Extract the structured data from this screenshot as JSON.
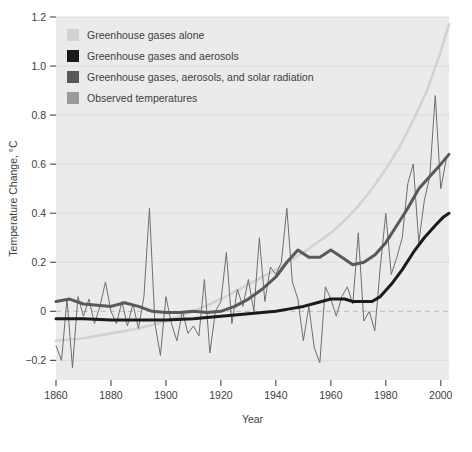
{
  "figure": {
    "plot_bg_color": "#ebebeb",
    "page_bg_color": "#ffffff",
    "grid_color": "#dcdcdc",
    "zero_line_color": "#b9b9b9",
    "text_color": "#3d3d3d",
    "tick_color": "#555555"
  },
  "chart_data": {
    "type": "line",
    "title": "",
    "xlabel": "Year",
    "ylabel": "Temperature Change, °C",
    "xlim": [
      1860,
      2003
    ],
    "ylim": [
      -0.28,
      1.2
    ],
    "xticks": [
      1860,
      1880,
      1900,
      1920,
      1940,
      1960,
      1980,
      2000
    ],
    "yticks": [
      -0.2,
      0,
      0.2,
      0.4,
      0.6,
      0.8,
      1.0,
      1.2
    ],
    "ytick_labels": [
      "−0.2",
      "0",
      "0.2",
      "0.4",
      "0.6",
      "0.8",
      "1.0",
      "1.2"
    ],
    "xtick_labels": [
      "1860",
      "1880",
      "1900",
      "1920",
      "1940",
      "1960",
      "1980",
      "2000"
    ],
    "grid": true,
    "legend_position": "top-left",
    "zero_reference_line": 0,
    "series": [
      {
        "name": "Greenhouse gases alone",
        "color": "#d2d2d2",
        "width": 2.6,
        "x": [
          1860,
          1870,
          1880,
          1890,
          1900,
          1910,
          1920,
          1930,
          1940,
          1950,
          1960,
          1965,
          1970,
          1975,
          1980,
          1985,
          1990,
          1995,
          2000,
          2003
        ],
        "values": [
          -0.12,
          -0.11,
          -0.09,
          -0.07,
          -0.04,
          0.0,
          0.05,
          0.11,
          0.17,
          0.24,
          0.32,
          0.37,
          0.43,
          0.5,
          0.58,
          0.67,
          0.78,
          0.9,
          1.06,
          1.17
        ]
      },
      {
        "name": "Greenhouse gases and aerosols",
        "color": "#1b1b1b",
        "width": 3.0,
        "x": [
          1860,
          1870,
          1880,
          1890,
          1900,
          1910,
          1920,
          1930,
          1940,
          1945,
          1950,
          1955,
          1960,
          1965,
          1968,
          1972,
          1975,
          1978,
          1982,
          1986,
          1990,
          1994,
          1998,
          2001,
          2003
        ],
        "values": [
          -0.03,
          -0.03,
          -0.035,
          -0.035,
          -0.035,
          -0.03,
          -0.02,
          -0.01,
          0.0,
          0.01,
          0.02,
          0.035,
          0.05,
          0.05,
          0.04,
          0.04,
          0.04,
          0.06,
          0.11,
          0.17,
          0.24,
          0.3,
          0.35,
          0.385,
          0.4
        ]
      },
      {
        "name": "Greenhouse gases, aerosols, and solar radiation",
        "color": "#595959",
        "width": 3.0,
        "x": [
          1860,
          1865,
          1870,
          1875,
          1880,
          1885,
          1890,
          1895,
          1900,
          1905,
          1910,
          1915,
          1920,
          1925,
          1930,
          1935,
          1940,
          1944,
          1948,
          1952,
          1956,
          1960,
          1964,
          1968,
          1972,
          1976,
          1980,
          1984,
          1988,
          1992,
          1996,
          2000,
          2003
        ],
        "values": [
          0.04,
          0.05,
          0.03,
          0.025,
          0.02,
          0.035,
          0.02,
          0.0,
          -0.005,
          -0.005,
          0.0,
          -0.005,
          0.0,
          0.02,
          0.05,
          0.09,
          0.14,
          0.2,
          0.25,
          0.22,
          0.22,
          0.25,
          0.22,
          0.19,
          0.2,
          0.23,
          0.28,
          0.35,
          0.42,
          0.5,
          0.55,
          0.6,
          0.64
        ]
      },
      {
        "name": "Observed temperatures",
        "color": "#6e6e6e",
        "width": 1.0,
        "x": [
          1860,
          1862,
          1864,
          1866,
          1868,
          1870,
          1872,
          1874,
          1876,
          1878,
          1880,
          1882,
          1884,
          1886,
          1888,
          1890,
          1892,
          1894,
          1896,
          1898,
          1900,
          1902,
          1904,
          1906,
          1908,
          1910,
          1912,
          1914,
          1916,
          1918,
          1920,
          1922,
          1924,
          1926,
          1928,
          1930,
          1932,
          1934,
          1936,
          1938,
          1940,
          1942,
          1944,
          1946,
          1948,
          1950,
          1952,
          1954,
          1956,
          1958,
          1960,
          1962,
          1964,
          1966,
          1968,
          1970,
          1972,
          1974,
          1976,
          1978,
          1980,
          1982,
          1984,
          1986,
          1988,
          1990,
          1992,
          1994,
          1996,
          1998,
          2000,
          2002
        ],
        "values": [
          -0.14,
          -0.2,
          0.05,
          -0.23,
          0.06,
          -0.02,
          0.05,
          -0.05,
          0.02,
          0.12,
          0.0,
          -0.05,
          0.04,
          -0.06,
          0.03,
          -0.07,
          0.06,
          0.42,
          -0.05,
          -0.18,
          0.06,
          -0.05,
          -0.12,
          0.0,
          -0.09,
          -0.06,
          -0.1,
          0.13,
          -0.17,
          0.0,
          0.04,
          0.24,
          -0.05,
          0.09,
          0.02,
          0.13,
          0.0,
          0.3,
          0.04,
          0.18,
          0.15,
          0.2,
          0.42,
          0.12,
          0.05,
          -0.12,
          0.02,
          -0.15,
          -0.21,
          0.1,
          0.05,
          -0.02,
          0.06,
          0.1,
          0.03,
          0.32,
          -0.04,
          0.0,
          -0.08,
          0.18,
          0.4,
          0.15,
          0.22,
          0.3,
          0.52,
          0.6,
          0.28,
          0.45,
          0.55,
          0.88,
          0.5,
          0.62
        ]
      }
    ],
    "legend": [
      {
        "label": "Greenhouse gases alone",
        "color": "#d2d2d2"
      },
      {
        "label": "Greenhouse gases and aerosols",
        "color": "#1b1b1b"
      },
      {
        "label": "Greenhouse gases, aerosols, and solar radiation",
        "color": "#595959"
      },
      {
        "label": "Observed temperatures",
        "color": "#9a9a9a"
      }
    ]
  }
}
